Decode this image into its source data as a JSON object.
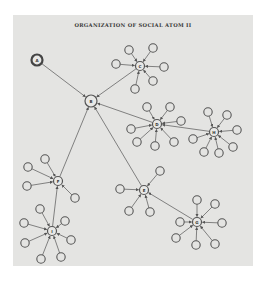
{
  "title": "ORGANIZATION OF SOCIAL ATOM II",
  "colors": {
    "panel": "#e4e4e2",
    "stroke": "#555555",
    "background": "#ffffff"
  },
  "nodes": [
    {
      "id": "A",
      "label": "A",
      "x": 37,
      "y": 60,
      "r": 5.5,
      "style": "bold"
    },
    {
      "id": "B",
      "label": "B",
      "x": 91,
      "y": 101,
      "r": 6,
      "style": "hub"
    },
    {
      "id": "C",
      "label": "C",
      "x": 140,
      "y": 66,
      "r": 4.5,
      "style": "hub"
    },
    {
      "id": "D",
      "label": "D",
      "x": 157,
      "y": 124,
      "r": 4.5,
      "style": "hub"
    },
    {
      "id": "H",
      "label": "H",
      "x": 214,
      "y": 132,
      "r": 4.5,
      "style": "hub"
    },
    {
      "id": "F",
      "label": "F",
      "x": 58,
      "y": 181,
      "r": 4.5,
      "style": "hub"
    },
    {
      "id": "I",
      "label": "I",
      "x": 52,
      "y": 231,
      "r": 4.5,
      "style": "hub"
    },
    {
      "id": "E",
      "label": "E",
      "x": 144,
      "y": 190,
      "r": 4.5,
      "style": "hub"
    },
    {
      "id": "G",
      "label": "G",
      "x": 197,
      "y": 222,
      "r": 4.5,
      "style": "hub"
    }
  ],
  "edges": [
    {
      "from": "A",
      "to": "B"
    },
    {
      "from": "C",
      "to": "B"
    },
    {
      "from": "D",
      "to": "B"
    },
    {
      "from": "H",
      "to": "D"
    },
    {
      "from": "F",
      "to": "B"
    },
    {
      "from": "I",
      "to": "F"
    },
    {
      "from": "E",
      "to": "B"
    },
    {
      "from": "G",
      "to": "E"
    }
  ],
  "satellites": {
    "C": [
      [
        129,
        50
      ],
      [
        153,
        48
      ],
      [
        116,
        64
      ],
      [
        164,
        67
      ],
      [
        153,
        81
      ],
      [
        135,
        89
      ]
    ],
    "D": [
      [
        147,
        107
      ],
      [
        170,
        107
      ],
      [
        181,
        121
      ],
      [
        131,
        129
      ],
      [
        137,
        142
      ],
      [
        155,
        146
      ],
      [
        174,
        142
      ]
    ],
    "H": [
      [
        208,
        112
      ],
      [
        227,
        115
      ],
      [
        237,
        130
      ],
      [
        193,
        139
      ],
      [
        204,
        152
      ],
      [
        219,
        153
      ],
      [
        233,
        147
      ]
    ],
    "F": [
      [
        45,
        159
      ],
      [
        28,
        167
      ],
      [
        27,
        186
      ],
      [
        75,
        198
      ]
    ],
    "I": [
      [
        40,
        209
      ],
      [
        24,
        223
      ],
      [
        65,
        221
      ],
      [
        25,
        243
      ],
      [
        71,
        240
      ],
      [
        41,
        259
      ],
      [
        61,
        257
      ]
    ],
    "E": [
      [
        160,
        171
      ],
      [
        120,
        189
      ],
      [
        129,
        211
      ],
      [
        150,
        212
      ]
    ],
    "G": [
      [
        197,
        200
      ],
      [
        215,
        204
      ],
      [
        180,
        222
      ],
      [
        222,
        223
      ],
      [
        176,
        238
      ],
      [
        196,
        245
      ],
      [
        215,
        244
      ]
    ]
  }
}
